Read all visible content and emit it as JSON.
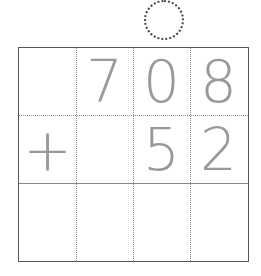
{
  "worksheet": {
    "operation": "addition",
    "operator_symbol": "+",
    "carry_box": "",
    "rows": [
      {
        "label": "addend-1",
        "cells": [
          "",
          "7",
          "0",
          "8"
        ]
      },
      {
        "label": "addend-2",
        "cells": [
          "+",
          "",
          "5",
          "2"
        ]
      },
      {
        "label": "answer",
        "cells": [
          "",
          "",
          "",
          ""
        ]
      }
    ],
    "colors": {
      "digit": "#999999",
      "border": "#555555",
      "guide": "#888888"
    }
  }
}
